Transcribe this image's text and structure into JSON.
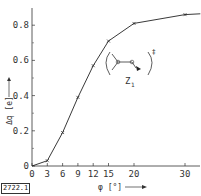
{
  "figure_id": "2722.1",
  "chart_data": {
    "type": "line",
    "title": "",
    "xlabel": "φ [°]",
    "ylabel": "Δq [e]",
    "x_ticks": [
      0,
      3,
      6,
      9,
      12,
      15,
      20,
      30
    ],
    "y_ticks": [
      0,
      0.2,
      0.4,
      0.6,
      0.8
    ],
    "y_tick_labels": [
      "0",
      "0.2",
      "0.4",
      "0.6",
      "0.8"
    ],
    "xlim": [
      0,
      33
    ],
    "ylim": [
      0,
      0.9
    ],
    "grid": false,
    "legend": null,
    "series": [
      {
        "name": "Z1",
        "x": [
          0,
          3,
          6,
          9,
          12,
          15,
          20,
          30
        ],
        "values": [
          0.0,
          0.03,
          0.19,
          0.39,
          0.57,
          0.71,
          0.81,
          0.86
        ],
        "markers": [
          3,
          6,
          9,
          12,
          15,
          20,
          30
        ]
      }
    ],
    "annotations": [
      {
        "text": "Z1",
        "description": "inset molecular structure (bracketed, with ‡ superscript)"
      }
    ]
  },
  "labels": {
    "inset_label": "Z",
    "inset_subscript": "1",
    "inset_superscript": "‡"
  }
}
